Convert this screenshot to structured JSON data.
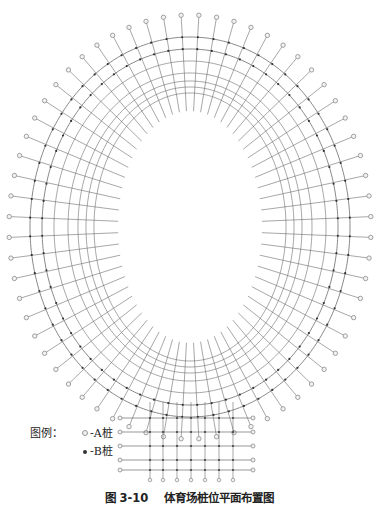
{
  "figure": {
    "caption_number": "图 3-10",
    "caption_title": "体育场桩位平面布置图"
  },
  "legend": {
    "title": "图例：",
    "items": [
      {
        "symbol": "open-circle",
        "label": "-A桩"
      },
      {
        "symbol": "filled-dot",
        "label": "-B桩"
      }
    ]
  },
  "plan": {
    "center": [
      190,
      227
    ],
    "outer_pile_ring": {
      "rx": 181,
      "ry": 212
    },
    "rings": [
      {
        "rx": 160,
        "ry": 190
      },
      {
        "rx": 148,
        "ry": 178
      },
      {
        "rx": 136,
        "ry": 166
      },
      {
        "rx": 122,
        "ry": 154
      },
      {
        "rx": 112,
        "ry": 146
      },
      {
        "rx": 104,
        "ry": 140
      },
      {
        "rx": 96,
        "ry": 134
      }
    ],
    "inner_opening": {
      "rx": 72,
      "ry": 116
    },
    "radial_count": 64,
    "bottom_grid": {
      "x_start": 120,
      "x_end": 253,
      "rows_y": [
        418,
        432,
        446,
        460,
        470
      ],
      "cols_x": [
        150,
        163,
        177,
        191,
        205,
        219,
        233
      ]
    },
    "colors": {
      "line": "#6b6b6b",
      "pile_a": "#8a8a8a",
      "pile_b": "#333333"
    }
  }
}
